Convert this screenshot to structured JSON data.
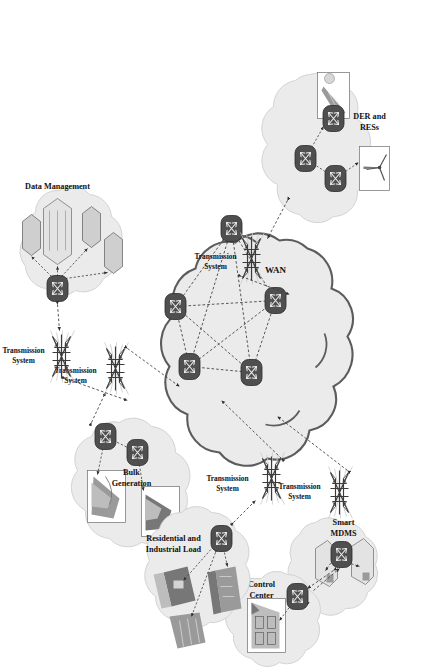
{
  "figure": {
    "orientation_deg": 90,
    "background": "#ffffff"
  },
  "colors": {
    "cloud_fill": "#ebebeb",
    "cloud_outline_soft": "#cfcfcf",
    "cloud_outline_hard": "#5c5c5c",
    "router_fill": "#4f4f4f",
    "link": "#3a3a3a",
    "text": "#111111"
  },
  "core": {
    "label": "WAN",
    "router_count": 5,
    "routers": [
      {
        "id": "r1",
        "name": "wan-router-1"
      },
      {
        "id": "r2",
        "name": "wan-router-2"
      },
      {
        "id": "r3",
        "name": "wan-router-3"
      },
      {
        "id": "r4",
        "name": "wan-router-4"
      },
      {
        "id": "r5",
        "name": "wan-router-5"
      }
    ],
    "topology": "full-mesh"
  },
  "domains": [
    {
      "id": "der",
      "label": "DER and RESs",
      "label_lines": [
        "DER and",
        "RESs"
      ],
      "nodes": 3,
      "assets": [
        "wind-turbine-photo",
        "solar-panel-photo"
      ]
    },
    {
      "id": "bulk",
      "label": "Bulk Generation",
      "label_lines": [
        "Bulk",
        "Generation"
      ],
      "nodes": 2,
      "assets": [
        "power-plant-photo",
        "hydro-plant-photo"
      ]
    },
    {
      "id": "datamgmt",
      "label": "Data Management",
      "label_lines": [
        "Data Management"
      ],
      "nodes": 1,
      "assets": [
        "database-hex-large",
        "database-hex-1",
        "database-hex-2",
        "database-hex-3"
      ]
    },
    {
      "id": "mdms",
      "label": "Smart MDMS",
      "label_lines": [
        "Smart",
        "MDMS"
      ],
      "nodes": 1,
      "assets": [
        "server-box-1",
        "server-box-2"
      ]
    },
    {
      "id": "control",
      "label": "Control Center",
      "label_lines": [
        "Control",
        "Center"
      ],
      "nodes": 1,
      "assets": [
        "control-room-photo"
      ]
    },
    {
      "id": "load",
      "label": "Residential and Industrial Load",
      "label_lines": [
        "Residential and",
        "Industrial Load"
      ],
      "nodes": 1,
      "assets": [
        "factory-photo",
        "house-photo",
        "industrial-photo"
      ]
    }
  ],
  "transmission": {
    "label": "Transmission System",
    "label_lines": [
      "Transmission",
      "System"
    ],
    "count": 5,
    "instances": [
      {
        "id": "tx-der",
        "serves": "DER and RESs"
      },
      {
        "id": "tx-bulk",
        "serves": "Bulk Generation"
      },
      {
        "id": "tx-datamgmt",
        "serves": "Data Management"
      },
      {
        "id": "tx-control",
        "serves": "Control Center"
      },
      {
        "id": "tx-load",
        "serves": "Residential and Industrial Load"
      }
    ]
  }
}
